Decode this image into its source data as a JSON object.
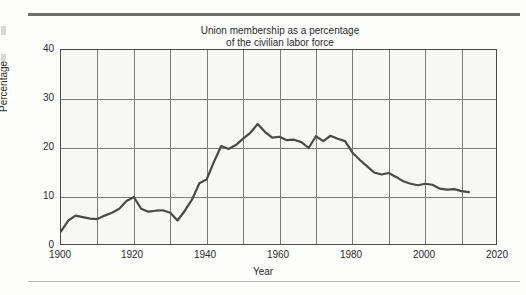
{
  "figure": {
    "title_line1": "Union membership as a percentage",
    "title_line2": "of the civilian labor force",
    "ylabel": "Percentage",
    "xlabel": "Year"
  },
  "axes": {
    "y_ticks": [
      "0",
      "10",
      "20",
      "30",
      "40"
    ],
    "x_ticks": [
      "1900",
      "1920",
      "1940",
      "1960",
      "1980",
      "2000",
      "2020"
    ]
  },
  "colors": {
    "line": "#4a4a4a",
    "grid": "#7a7a7a",
    "frame": "#4a4a4a",
    "plot_background": "#f7f7f6",
    "page_background": "#fdfdfc",
    "rule_top": "#6d6d6d",
    "rule_bottom": "#b4b4b4",
    "text": "#2b2b2b"
  },
  "chart_data": {
    "type": "line",
    "title": "Union membership as a percentage of the civilian labor force",
    "xlabel": "Year",
    "ylabel": "Percentage",
    "xlim": [
      1900,
      2020
    ],
    "ylim": [
      0,
      40
    ],
    "y_ticks": [
      0,
      10,
      20,
      30,
      40
    ],
    "x_ticks": [
      1900,
      1920,
      1940,
      1960,
      1980,
      2000,
      2020
    ],
    "x_minor_ticks": [
      1910,
      1930,
      1950,
      1970,
      1990,
      2010
    ],
    "grid": true,
    "legend": null,
    "series": [
      {
        "name": "Union membership as a percentage of the civilian labor force",
        "x": [
          1900,
          1902,
          1904,
          1906,
          1908,
          1910,
          1912,
          1914,
          1916,
          1918,
          1920,
          1922,
          1924,
          1926,
          1928,
          1930,
          1932,
          1934,
          1936,
          1938,
          1940,
          1942,
          1944,
          1946,
          1948,
          1950,
          1952,
          1954,
          1956,
          1958,
          1960,
          1962,
          1964,
          1966,
          1968,
          1970,
          1972,
          1974,
          1976,
          1978,
          1980,
          1982,
          1984,
          1986,
          1988,
          1990,
          1992,
          1994,
          1996,
          1998,
          2000,
          2002,
          2004,
          2006,
          2008,
          2010,
          2012
        ],
        "y": [
          3.0,
          5.2,
          6.2,
          5.9,
          5.6,
          5.5,
          6.2,
          6.8,
          7.6,
          9.2,
          10.0,
          7.6,
          7.0,
          7.2,
          7.3,
          6.8,
          5.2,
          7.2,
          9.5,
          12.8,
          13.6,
          17.2,
          20.4,
          19.8,
          20.6,
          21.9,
          23.1,
          24.9,
          23.3,
          22.1,
          22.3,
          21.6,
          21.7,
          21.2,
          20.0,
          22.4,
          21.4,
          22.5,
          21.9,
          21.4,
          19.1,
          17.6,
          16.3,
          15.0,
          14.6,
          14.9,
          14.1,
          13.2,
          12.7,
          12.4,
          12.7,
          12.5,
          11.7,
          11.5,
          11.6,
          11.2,
          11.0
        ],
        "notes": "Rises from about 3% in 1900 to a 1920 peak near 10%, dips to about 5% in 1932, climbs steeply through the 1930s-1940s, peaks near 25% around 1954, then declines steadily to about 11% by 2012."
      }
    ]
  }
}
